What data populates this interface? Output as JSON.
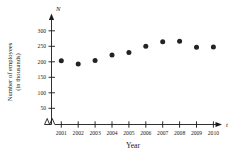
{
  "chart_data": {
    "type": "scatter",
    "title": "",
    "xlabel": "Year",
    "ylabel": "Number of employees (in thousands)",
    "x_axis_variable": "t",
    "y_axis_variable": "N",
    "categories": [
      "2001",
      "2002",
      "2003",
      "2004",
      "2005",
      "2006",
      "2007",
      "2008",
      "2009",
      "2010"
    ],
    "x": [
      2001,
      2002,
      2003,
      2004,
      2005,
      2006,
      2007,
      2008,
      2009,
      2010
    ],
    "values": [
      203,
      193,
      204,
      222,
      230,
      250,
      265,
      266,
      247,
      248
    ],
    "ylim": [
      0,
      310
    ],
    "yticks": [
      50,
      100,
      150,
      200,
      250,
      300
    ],
    "ytick_labels": [
      "50",
      "100",
      "150",
      "200",
      "250",
      "300"
    ],
    "xtick_labels": [
      "2001",
      "2002",
      "2003",
      "2004",
      "2005",
      "2006",
      "2007",
      "2008",
      "2009",
      "2010"
    ],
    "grid": false,
    "legend": null,
    "axis_break_x": true,
    "marker": "filled-circle",
    "marker_color": "#232323",
    "axis_color": "#1a1a1a"
  },
  "labels": {
    "y_title_line1": "Number of employees",
    "y_title_line2": "(in thousands)",
    "x_title": "Year",
    "y_var": "N",
    "x_var": "t"
  }
}
